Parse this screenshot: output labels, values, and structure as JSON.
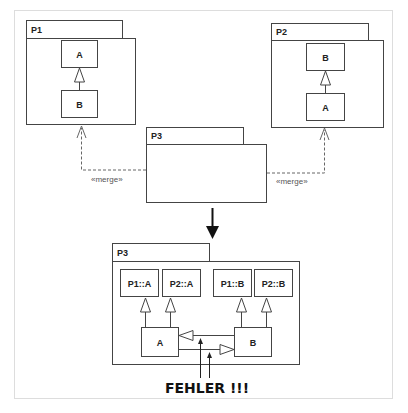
{
  "diagram": {
    "colors": {
      "line": "#444444",
      "frame": "#dddddd",
      "dashed": "#666666",
      "text": "#222222"
    },
    "top": {
      "packages": [
        {
          "name": "P1",
          "classes": [
            {
              "label": "A"
            },
            {
              "label": "B"
            }
          ],
          "relation": "B generalizes A"
        },
        {
          "name": "P2",
          "classes": [
            {
              "label": "B"
            },
            {
              "label": "A"
            }
          ],
          "relation": "A generalizes B"
        },
        {
          "name": "P3",
          "classes": []
        }
      ],
      "merges": [
        {
          "from": "P3",
          "to": "P1",
          "label": "«merge»"
        },
        {
          "from": "P3",
          "to": "P2",
          "label": "«merge»"
        }
      ]
    },
    "result": {
      "package_name": "P3",
      "classes": [
        {
          "label": "P1::A"
        },
        {
          "label": "P2::A"
        },
        {
          "label": "P1::B"
        },
        {
          "label": "P2::B"
        },
        {
          "label": "A"
        },
        {
          "label": "B"
        }
      ],
      "error_label": "FEHLER !!!"
    }
  }
}
